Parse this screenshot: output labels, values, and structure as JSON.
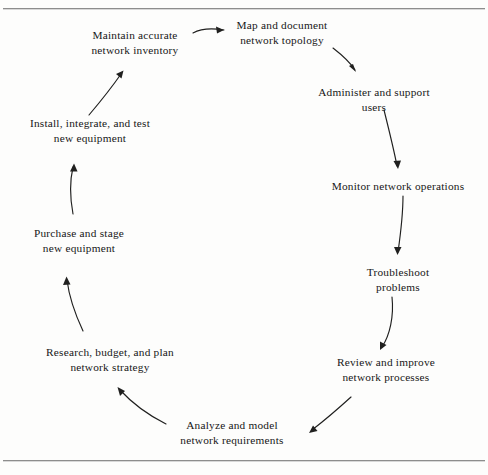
{
  "figure": {
    "type": "cycle-diagram",
    "title": "",
    "orientation": "clockwise",
    "frame": {
      "top_rule": true,
      "bottom_rule": true,
      "rule_color": "#8d8d8d",
      "background": "#fdfdfc"
    },
    "text_color": "#171717",
    "arrow_color": "#20201f"
  },
  "nodes": [
    {
      "id": "maintain",
      "label": "Maintain accurate\nnetwork inventory"
    },
    {
      "id": "map",
      "label": "Map and document\nnetwork topology"
    },
    {
      "id": "administer",
      "label": "Administer and support\nusers"
    },
    {
      "id": "monitor",
      "label": "Monitor network operations"
    },
    {
      "id": "troubleshoot",
      "label": "Troubleshoot\nproblems"
    },
    {
      "id": "review",
      "label": "Review and improve\nnetwork processes"
    },
    {
      "id": "analyze",
      "label": "Analyze and model\nnetwork requirements"
    },
    {
      "id": "research",
      "label": "Research, budget, and plan\nnetwork strategy"
    },
    {
      "id": "purchase",
      "label": "Purchase and stage\nnew equipment"
    },
    {
      "id": "install",
      "label": "Install, integrate, and test\nnew equipment"
    }
  ],
  "edges": [
    {
      "id": "maintain-to-map",
      "from": "maintain",
      "to": "map"
    },
    {
      "id": "map-to-administer",
      "from": "map",
      "to": "administer"
    },
    {
      "id": "administer-to-monitor",
      "from": "administer",
      "to": "monitor"
    },
    {
      "id": "monitor-to-troubleshoot",
      "from": "monitor",
      "to": "troubleshoot"
    },
    {
      "id": "troubleshoot-to-review",
      "from": "troubleshoot",
      "to": "review"
    },
    {
      "id": "review-to-analyze",
      "from": "review",
      "to": "analyze"
    },
    {
      "id": "analyze-to-research",
      "from": "analyze",
      "to": "research"
    },
    {
      "id": "research-to-purchase",
      "from": "research",
      "to": "purchase"
    },
    {
      "id": "purchase-to-install",
      "from": "purchase",
      "to": "install"
    },
    {
      "id": "install-to-maintain",
      "from": "install",
      "to": "maintain"
    }
  ]
}
